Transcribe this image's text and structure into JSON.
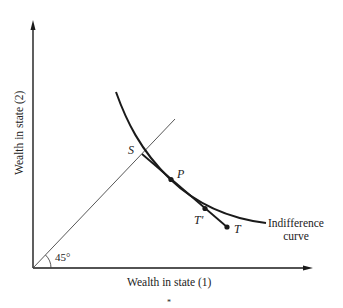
{
  "figure": {
    "type": "indifference-curve-diagram",
    "axes": {
      "x_label": "Wealth in state (1)",
      "y_label": "Wealth in state (2)"
    },
    "angle_label": "45°",
    "curve_label_line1": "Indifference",
    "curve_label_line2": "curve",
    "points": {
      "S": "S",
      "P": "P",
      "T_prime": "T′",
      "T": "T"
    },
    "footer_mark": "*",
    "colors": {
      "ink": "#1a1a1a",
      "thin_line": "#444444",
      "background": "#ffffff"
    }
  }
}
